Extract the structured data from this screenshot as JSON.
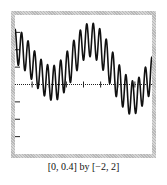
{
  "caption": "[0, 0.4] by [−2, 2]",
  "chart_data": {
    "type": "line",
    "title": "",
    "xlabel": "",
    "ylabel": "",
    "window_label": "[0, 0.4] by [−2, 2]",
    "xlim": [
      0,
      0.4
    ],
    "ylim": [
      -2,
      2
    ],
    "x_tick_step": 0.05,
    "y_tick_step": 0.5,
    "grid": false,
    "axis_style": "dotted x-axis at y=0 with tick marks; y tick marks on left edge",
    "series": [
      {
        "name": "y(x)",
        "description": "high-frequency oscillation (~21 cycles, amplitude ~0.5) superimposed on a slow wave",
        "x": [
          0,
          0.02,
          0.04,
          0.06,
          0.08,
          0.1,
          0.12,
          0.14,
          0.16,
          0.18,
          0.2,
          0.22,
          0.24,
          0.26,
          0.28,
          0.3,
          0.32,
          0.34,
          0.36,
          0.38,
          0.4
        ],
        "envelope_center": [
          1.1,
          1.0,
          0.75,
          0.45,
          0.2,
          0.05,
          0.05,
          0.25,
          0.55,
          0.9,
          1.2,
          1.3,
          1.2,
          0.9,
          0.5,
          0.1,
          -0.2,
          -0.4,
          -0.3,
          0.0,
          0.3
        ]
      }
    ]
  },
  "colors": {
    "frame": "#c4c4c4",
    "curve": "#111111",
    "axis": "#222222",
    "background": "#ffffff"
  }
}
